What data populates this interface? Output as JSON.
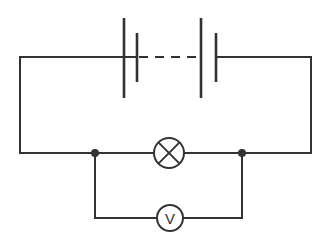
{
  "diagram": {
    "type": "electrical-schematic",
    "background_color": "#ffffff",
    "line_color": "#333333",
    "line_width": 2
  },
  "components": {
    "battery": {
      "name": "battery",
      "label": "",
      "cell_count": 2,
      "symbol": "cell-pair-with-dashed-link",
      "cells": [
        {
          "name": "cell-1",
          "long_plate_x": 124,
          "long_plate_y1": 18,
          "long_plate_y2": 98,
          "short_plate_x": 137,
          "short_plate_y1": 33,
          "short_plate_y2": 82
        },
        {
          "name": "cell-2",
          "long_plate_x": 201,
          "long_plate_y1": 18,
          "long_plate_y2": 98,
          "short_plate_x": 216,
          "short_plate_y1": 33,
          "short_plate_y2": 82
        }
      ],
      "dashed_link": {
        "x1": 139,
        "x2": 199,
        "y": 57
      }
    },
    "lamp": {
      "name": "lamp",
      "label": "",
      "symbol": "crossed-circle",
      "center_x": 169,
      "center_y": 153,
      "radius": 15
    },
    "voltmeter": {
      "name": "voltmeter",
      "label": "V",
      "symbol": "circle-with-letter",
      "center_x": 170,
      "center_y": 218,
      "radius": 13
    },
    "junctions": [
      {
        "name": "junction-left",
        "x": 95,
        "y": 153,
        "radius": 4
      },
      {
        "name": "junction-right",
        "x": 242,
        "y": 153,
        "radius": 4
      }
    ]
  },
  "wires": {
    "outer_loop": {
      "name": "main-loop",
      "top_left": {
        "x": 20,
        "y": 57
      },
      "top_right": {
        "x": 311,
        "y": 57
      },
      "bottom_left": {
        "x": 20,
        "y": 153
      },
      "bottom_right": {
        "x": 311,
        "y": 153
      }
    },
    "voltmeter_branch": {
      "name": "voltmeter-branch",
      "left_x": 95,
      "right_x": 242,
      "top_y": 153,
      "bottom_y": 218
    }
  }
}
